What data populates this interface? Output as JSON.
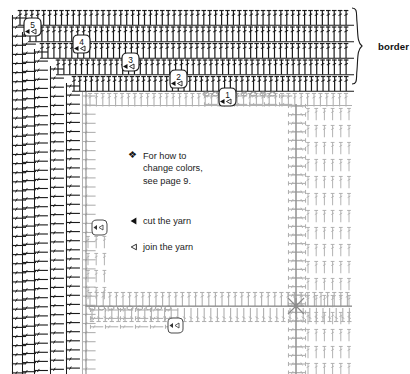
{
  "diagram": {
    "type": "crochet-stitch-chart",
    "title_visible": false,
    "background_color": "#ffffff",
    "ink_dark": "#1a1a1a",
    "ink_mid": "#6f6f6f",
    "ink_light": "#b4b4b4"
  },
  "annotations": {
    "border_label": "border",
    "brace": "right-curly-brace"
  },
  "notes": {
    "bullet_symbol": "❖",
    "line1": "For how to",
    "line2": "change colors,",
    "line3": "see page 9."
  },
  "legend": {
    "items": [
      {
        "symbol": "filled-left-triangle",
        "glyph": "◂",
        "label": "cut the yarn"
      },
      {
        "symbol": "outline-left-triangle",
        "glyph": "◁",
        "label": "join the yarn"
      }
    ]
  },
  "row_markers": {
    "description": "numbered round-start markers in a diagonal staircase, outermost row first",
    "items": [
      {
        "number": "5",
        "x": 24,
        "y": 18
      },
      {
        "number": "4",
        "x": 73,
        "y": 35
      },
      {
        "number": "3",
        "x": 122,
        "y": 53
      },
      {
        "number": "2",
        "x": 170,
        "y": 70
      },
      {
        "number": "1",
        "x": 219,
        "y": 88
      }
    ]
  },
  "chart_data": {
    "type": "table",
    "legend_position": "center",
    "grid": false,
    "stitch_symbol": "double-crochet",
    "border_rounds": 5,
    "series": [
      {
        "name": "border round 5",
        "tone": "dark",
        "orientation": "horizontal",
        "stitch_count": 56
      },
      {
        "name": "border round 4",
        "tone": "dark",
        "orientation": "horizontal",
        "stitch_count": 54
      },
      {
        "name": "border round 3",
        "tone": "dark",
        "orientation": "horizontal",
        "stitch_count": 52
      },
      {
        "name": "border round 2",
        "tone": "dark",
        "orientation": "horizontal",
        "stitch_count": 50
      },
      {
        "name": "border round 1",
        "tone": "dark",
        "orientation": "horizontal",
        "stitch_count": 48
      },
      {
        "name": "left panel columns",
        "tone": "dark",
        "orientation": "vertical",
        "stitch_count": 5
      },
      {
        "name": "motif body",
        "tone": "light",
        "orientation": "mixed",
        "stitch_count": 0
      }
    ]
  }
}
